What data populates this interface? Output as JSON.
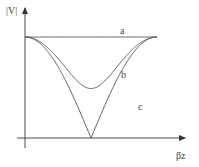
{
  "chart_data": {
    "type": "line",
    "title": "",
    "xlabel": "βz",
    "ylabel": "|V|",
    "xlim": [
      0,
      6.2832
    ],
    "ylim": [
      0,
      1
    ],
    "grid": false,
    "legend": "none",
    "series": [
      {
        "name": "a",
        "description": "matched line, constant magnitude",
        "x": [
          0,
          3.1416,
          6.2832
        ],
        "values": [
          1,
          1,
          1
        ]
      },
      {
        "name": "b",
        "description": "partial standing wave",
        "x": [
          0,
          0.7854,
          1.5708,
          2.3562,
          3.1416,
          3.927,
          4.7124,
          5.4978,
          6.2832
        ],
        "values": [
          1,
          0.79,
          0.49,
          0.79,
          1,
          0.79,
          0.49,
          0.79,
          1
        ]
      },
      {
        "name": "c",
        "description": "full standing wave |cos(βz)|",
        "x": [
          0,
          0.7854,
          1.5708,
          2.3562,
          3.1416,
          3.927,
          4.7124,
          5.4978,
          6.2832
        ],
        "values": [
          1,
          0.707,
          0,
          0.707,
          1,
          0.707,
          0,
          0.707,
          1
        ]
      }
    ],
    "annotations": [
      "a",
      "b",
      "c"
    ]
  }
}
